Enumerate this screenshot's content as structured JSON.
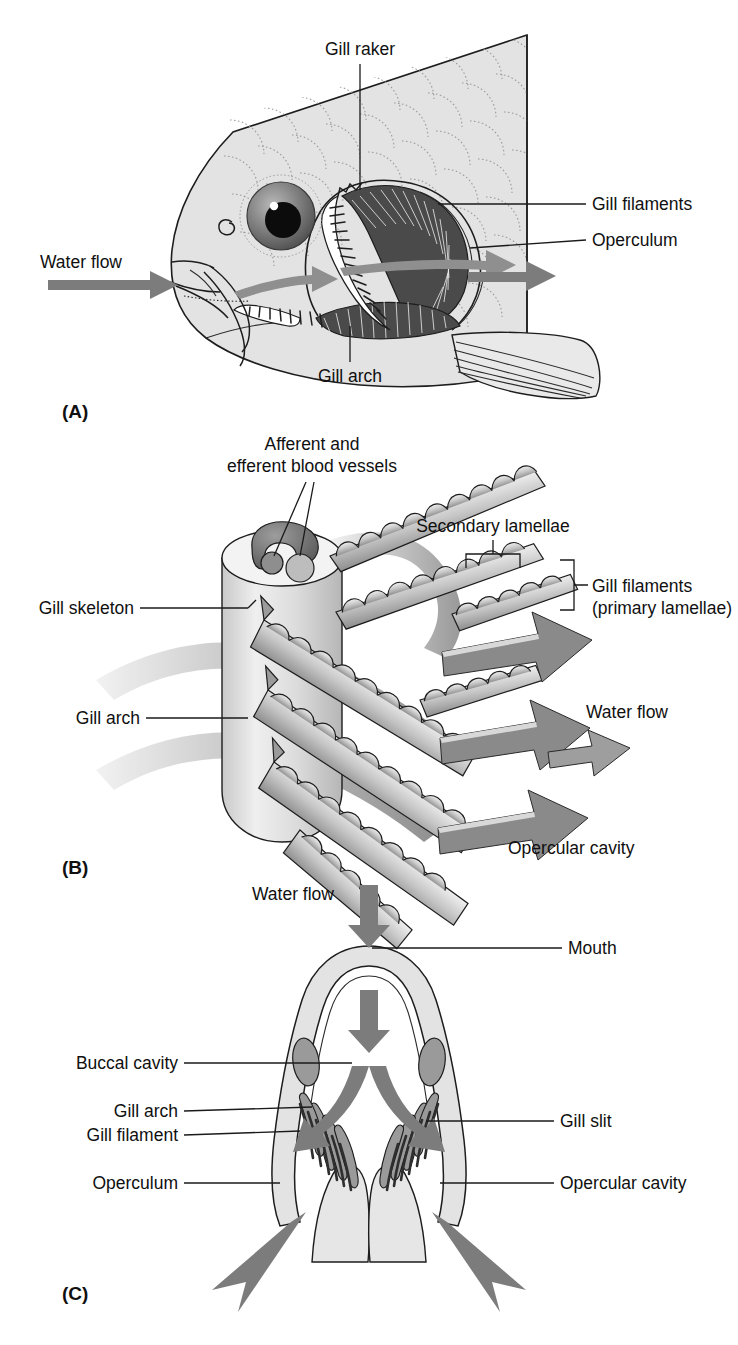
{
  "figure": {
    "panels": [
      "A",
      "B",
      "C"
    ]
  },
  "colors": {
    "body_fill": "#e3e3e3",
    "body_fill_light": "#ebebeb",
    "arrow_gray": "#7c7c7c",
    "arrow_gray_dark": "#6d6d6d",
    "filament_dark": "#3a3a3a",
    "mid_gray": "#9a9a9a",
    "light_gray": "#cfcfcf",
    "line": "#1a1a1a",
    "text": "#101010"
  },
  "panel_a": {
    "tag": "(A)",
    "labels": {
      "gill_raker": "Gill raker",
      "gill_filaments": "Gill filaments",
      "operculum": "Operculum",
      "gill_arch": "Gill arch",
      "water_flow": "Water flow"
    }
  },
  "panel_b": {
    "tag": "(B)",
    "labels": {
      "afferent_line1": "Afferent and",
      "afferent_line2": "efferent blood vessels",
      "gill_skeleton": "Gill skeleton",
      "gill_arch": "Gill arch",
      "secondary_lamellae": "Secondary lamellae",
      "gill_filaments_line1": "Gill filaments",
      "gill_filaments_line2": "(primary lamellae)",
      "water_flow": "Water flow",
      "opercular_cavity": "Opercular cavity"
    }
  },
  "panel_c": {
    "tag": "(C)",
    "labels": {
      "water_flow": "Water flow",
      "mouth": "Mouth",
      "buccal_cavity": "Buccal cavity",
      "gill_arch": "Gill arch",
      "gill_filament": "Gill filament",
      "operculum": "Operculum",
      "gill_slit": "Gill slit",
      "opercular_cavity": "Opercular cavity"
    }
  }
}
